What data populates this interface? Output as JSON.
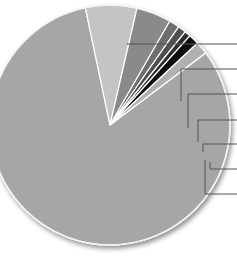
{
  "chart_data": {
    "type": "pie",
    "title": "",
    "labels": [
      "",
      "",
      "",
      "",
      "",
      "",
      "",
      ""
    ],
    "values": [
      81.9,
      6.9,
      4.7,
      1.4,
      1.1,
      0.8,
      1.4,
      1.7
    ],
    "unit": "percent (estimated)",
    "colors": [
      "#a6a6a6",
      "#c4c4c4",
      "#8a8a8a",
      "#6e6e6e",
      "#4f4f4f",
      "#2e2e2e",
      "#0a0a0a",
      "#b0b0b0"
    ],
    "start_angle_deg": 37,
    "direction": "clockwise",
    "legend": "none",
    "leader_lines": 7,
    "center": [
      110,
      125
    ],
    "radius": 120
  },
  "leaders": [
    {
      "y": 44,
      "x_start": 127,
      "x_elbow": 127,
      "y_end": 44
    },
    {
      "y": 69,
      "x_start": 181,
      "x_elbow": 181,
      "y_end": 101
    },
    {
      "y": 94,
      "x_start": 188,
      "x_elbow": 188,
      "y_end": 128
    },
    {
      "y": 120,
      "x_start": 198,
      "x_elbow": 198,
      "y_end": 142
    },
    {
      "y": 144,
      "x_start": 203,
      "x_elbow": 203,
      "y_end": 152
    },
    {
      "y": 169,
      "x_start": 210,
      "x_elbow": 210,
      "y_end": 162
    },
    {
      "y": 194,
      "x_start": 205,
      "x_elbow": 205,
      "y_end": 160
    }
  ]
}
